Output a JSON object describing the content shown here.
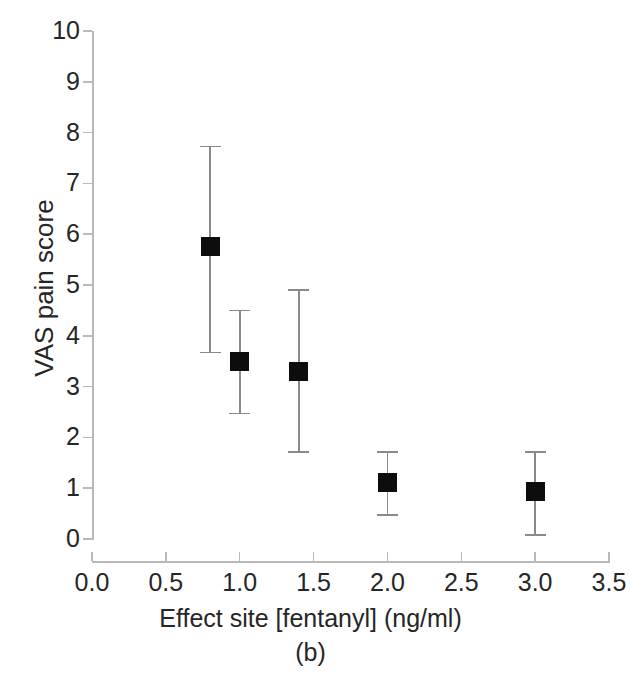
{
  "chart_data": {
    "type": "scatter",
    "title": "",
    "subtitle": "",
    "xlabel": "Effect site [fentanyl] (ng/ml)",
    "ylabel": "VAS pain score",
    "caption": "(b)",
    "xlim": [
      0.0,
      3.5
    ],
    "ylim": [
      0,
      10
    ],
    "grid": false,
    "legend": "none",
    "marker_style": "filled-square",
    "marker_color": "#0d0d0d",
    "errorbar_color": "#8a8a8a",
    "axis_color": "#b9b9b9",
    "error_type": "mean with error bars",
    "x": [
      0.8,
      1.0,
      1.4,
      2.0,
      3.0
    ],
    "values": [
      5.75,
      3.5,
      3.3,
      1.12,
      0.93
    ],
    "err_low": [
      3.67,
      2.47,
      1.71,
      0.47,
      0.08
    ],
    "err_high": [
      7.73,
      4.5,
      4.9,
      1.71,
      1.71
    ],
    "points": [
      {
        "x": 0.8,
        "y": 5.75,
        "low": 3.67,
        "high": 7.73
      },
      {
        "x": 1.0,
        "y": 3.5,
        "low": 2.47,
        "high": 4.5
      },
      {
        "x": 1.4,
        "y": 3.3,
        "low": 1.71,
        "high": 4.9
      },
      {
        "x": 2.0,
        "y": 1.12,
        "low": 0.47,
        "high": 1.71
      },
      {
        "x": 3.0,
        "y": 0.93,
        "low": 0.08,
        "high": 1.71
      }
    ],
    "xticks": [
      0.0,
      0.5,
      1.0,
      1.5,
      2.0,
      2.5,
      3.0,
      3.5
    ],
    "xtick_labels": [
      "0.0",
      "0.5",
      "1.0",
      "1.5",
      "2.0",
      "2.5",
      "3.0",
      "3.5"
    ],
    "yticks": [
      0,
      1,
      2,
      3,
      4,
      5,
      6,
      7,
      8,
      9,
      10
    ],
    "ytick_labels": [
      "0",
      "1",
      "2",
      "3",
      "4",
      "5",
      "6",
      "7",
      "8",
      "9",
      "10"
    ]
  }
}
